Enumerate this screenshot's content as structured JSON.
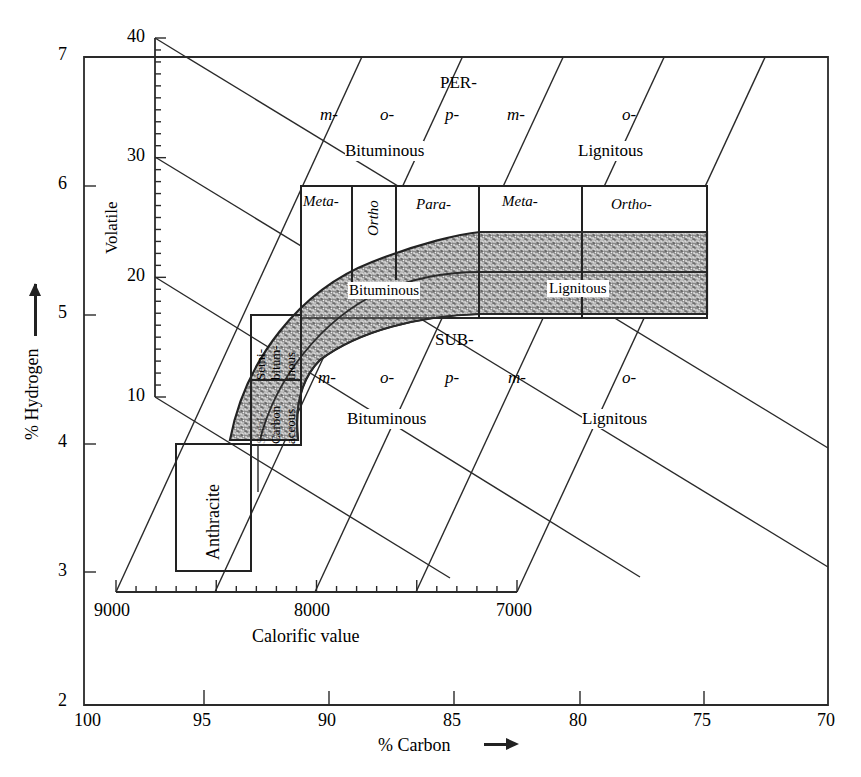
{
  "diagram": {
    "type": "coal classification chart (Seyler)",
    "axes": {
      "hydrogen": {
        "label": "% Hydrogen",
        "arrow": "up-arrow",
        "ticks": [
          "7",
          "6",
          "5",
          "4",
          "3",
          "2"
        ]
      },
      "carbon": {
        "label": "% Carbon",
        "arrow": "right-arrow",
        "ticks": [
          "100",
          "95",
          "90",
          "85",
          "80",
          "75",
          "70"
        ]
      },
      "volatile": {
        "label": "Volatile",
        "ticks": [
          "40",
          "30",
          "20",
          "10"
        ]
      },
      "calorific": {
        "label": "Calorific value",
        "ticks": [
          "9000",
          "8000",
          "7000"
        ]
      }
    },
    "upper_group": {
      "prefix": "PER-",
      "sub_ranks": [
        "m-",
        "o-",
        "p-",
        "m-",
        "o-"
      ],
      "classes": [
        "Bituminous",
        "Lignitous"
      ]
    },
    "main_band": {
      "header_cells": [
        "Meta-",
        "Ortho",
        "Para-",
        "Meta-",
        "Ortho-"
      ],
      "classes": [
        "Bituminous",
        "Lignitous"
      ]
    },
    "lower_group": {
      "prefix": "SUB-",
      "sub_ranks": [
        "m-",
        "o-",
        "p-",
        "m-",
        "o-"
      ],
      "classes": [
        "Bituminous",
        "Lignitous"
      ]
    },
    "left_boxes": {
      "semi_bituminous": [
        "Semi-",
        "bitum-",
        "inous"
      ],
      "semi_carbonaceous": [
        "Semi-",
        "Carbon",
        "aceous"
      ],
      "anthracite": "Anthracite"
    }
  }
}
